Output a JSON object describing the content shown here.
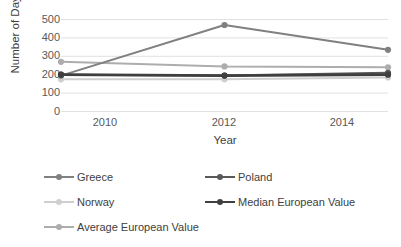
{
  "chart_data": {
    "type": "line",
    "title": "",
    "xlabel": "Year",
    "ylabel": "Number of Days",
    "categories": [
      "2010",
      "2012",
      "2014"
    ],
    "x": [
      2010,
      2012,
      2014
    ],
    "ylim": [
      0,
      500
    ],
    "yticks": [
      "0",
      "100",
      "200",
      "300",
      "400",
      "500"
    ],
    "grid": "horizontal",
    "legend_position": "bottom",
    "series": [
      {
        "name": "Greece",
        "values": [
          195,
          470,
          335
        ],
        "color": "#808080",
        "width": 2.0
      },
      {
        "name": "Poland",
        "values": [
          200,
          195,
          210
        ],
        "color": "#595959",
        "width": 2.0
      },
      {
        "name": "Norway",
        "values": [
          175,
          175,
          185
        ],
        "color": "#cfcfcf",
        "width": 2.0
      },
      {
        "name": "Median European Value",
        "values": [
          200,
          195,
          200
        ],
        "color": "#3f3f3f",
        "width": 2.8
      },
      {
        "name": "Average European Value",
        "values": [
          270,
          245,
          240
        ],
        "color": "#adadad",
        "width": 2.0
      }
    ]
  },
  "axes": {
    "y_title": "Number of Days",
    "x_title": "Year",
    "y_ticks": [
      "500",
      "400",
      "300",
      "200",
      "100",
      "0"
    ],
    "x_ticks": [
      "2010",
      "2012",
      "2014"
    ]
  },
  "legend": {
    "items": [
      {
        "label": "Greece"
      },
      {
        "label": "Poland"
      },
      {
        "label": "Norway"
      },
      {
        "label": "Median European Value"
      },
      {
        "label": "Average European Value"
      }
    ]
  }
}
